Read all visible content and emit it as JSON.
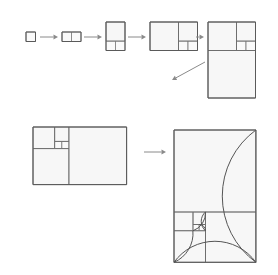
{
  "figure": {
    "background_color": "#ffffff",
    "square_fill": "#f7f7f7",
    "square_stroke": "#6e6e6e",
    "outline_stroke": "#5a5a5a",
    "spiral_stroke": "#555555",
    "arrow_color": "#8a8a8a"
  },
  "sequence": {
    "label": "top-row-growth-sequence",
    "steps": [
      {
        "index": 1,
        "name": "step-1",
        "fibonacci_numbers": [
          1
        ],
        "width_units": 1,
        "height_units": 1,
        "x": 26,
        "y": 32,
        "unit_px": 9.5
      },
      {
        "index": 2,
        "name": "step-2",
        "fibonacci_numbers": [
          1,
          1
        ],
        "width_units": 2,
        "height_units": 1,
        "x": 62,
        "y": 32,
        "unit_px": 9.5
      },
      {
        "index": 3,
        "name": "step-3",
        "fibonacci_numbers": [
          1,
          1,
          2
        ],
        "width_units": 2,
        "height_units": 3,
        "x": 106,
        "y": 22,
        "unit_px": 9.5
      },
      {
        "index": 4,
        "name": "step-4",
        "fibonacci_numbers": [
          1,
          1,
          2,
          3
        ],
        "width_units": 5,
        "height_units": 3,
        "x": 150,
        "y": 22,
        "unit_px": 9.5
      },
      {
        "index": 5,
        "name": "step-5",
        "fibonacci_numbers": [
          1,
          1,
          2,
          3,
          5
        ],
        "width_units": 5,
        "height_units": 8,
        "x": 208,
        "y": 22,
        "unit_px": 9.5
      }
    ],
    "arrows": [
      {
        "name": "arrow-step1-step2",
        "x1": 40,
        "y1": 37,
        "x2": 58,
        "y2": 37
      },
      {
        "name": "arrow-step2-step3",
        "x1": 84,
        "y1": 37,
        "x2": 102,
        "y2": 37
      },
      {
        "name": "arrow-step3-step4",
        "x1": 128,
        "y1": 37,
        "x2": 146,
        "y2": 37
      },
      {
        "name": "arrow-step4-step5",
        "x1": 196,
        "y1": 37,
        "x2": 204,
        "y2": 37
      }
    ],
    "wrap_arrow": {
      "name": "arrow-wrap-to-bottom-row",
      "x1": 205,
      "y1": 62,
      "x2": 172,
      "y2": 80
    }
  },
  "bottom_left": {
    "label": "fibonacci-tiling-8x13",
    "fibonacci_numbers": [
      1,
      1,
      2,
      3,
      5,
      8
    ],
    "width_units": 13,
    "height_units": 8,
    "x": 33,
    "y": 127,
    "unit_px": 7.2
  },
  "bottom_arrow": {
    "name": "arrow-tiling-to-spiral",
    "x1": 144,
    "y1": 152,
    "x2": 166,
    "y2": 152
  },
  "bottom_right": {
    "label": "golden-spiral-on-fibonacci-tiling",
    "fibonacci_numbers": [
      1,
      1,
      2,
      3,
      5,
      8,
      13
    ],
    "width_units": 13,
    "height_units": 21,
    "x": 174,
    "y": 130,
    "unit_px": 6.3,
    "spiral_turns": 5
  }
}
